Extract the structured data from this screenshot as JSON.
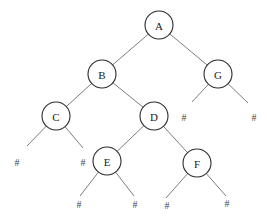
{
  "diagram": {
    "type": "binary-tree",
    "null_marker": "#",
    "node_radius": 14,
    "nodes": [
      {
        "id": "A",
        "label": "A",
        "x": 159,
        "y": 25
      },
      {
        "id": "B",
        "label": "B",
        "x": 102,
        "y": 74
      },
      {
        "id": "G",
        "label": "G",
        "x": 218,
        "y": 74
      },
      {
        "id": "C",
        "label": "C",
        "x": 56,
        "y": 116
      },
      {
        "id": "D",
        "label": "D",
        "x": 154,
        "y": 116
      },
      {
        "id": "E",
        "label": "E",
        "x": 107,
        "y": 161
      },
      {
        "id": "F",
        "label": "F",
        "x": 197,
        "y": 163
      }
    ],
    "null_leaves": [
      {
        "id": "G-left",
        "label": "#",
        "x": 184,
        "y": 117,
        "line_end": [
          192,
          102
        ]
      },
      {
        "id": "G-right",
        "label": "#",
        "x": 254,
        "y": 117,
        "line_end": [
          248,
          103
        ]
      },
      {
        "id": "C-left",
        "label": "#",
        "x": 17,
        "y": 162,
        "line_end": [
          27,
          146
        ]
      },
      {
        "id": "C-right",
        "label": "#",
        "x": 83,
        "y": 162,
        "line_end": [
          83,
          148
        ]
      },
      {
        "id": "E-left",
        "label": "#",
        "x": 79,
        "y": 204,
        "line_end": [
          80,
          196
        ]
      },
      {
        "id": "E-right",
        "label": "#",
        "x": 135,
        "y": 204,
        "line_end": [
          134,
          196
        ]
      },
      {
        "id": "F-left",
        "label": "#",
        "x": 167,
        "y": 205,
        "line_end": [
          166,
          198
        ]
      },
      {
        "id": "F-right",
        "label": "#",
        "x": 227,
        "y": 203,
        "line_end": [
          226,
          196
        ]
      }
    ],
    "edges": [
      {
        "from": "A",
        "to": "B"
      },
      {
        "from": "A",
        "to": "G"
      },
      {
        "from": "B",
        "to": "C"
      },
      {
        "from": "B",
        "to": "D"
      },
      {
        "from": "D",
        "to": "E"
      },
      {
        "from": "D",
        "to": "F"
      }
    ],
    "null_edges": [
      {
        "from": "G",
        "to": "G-left"
      },
      {
        "from": "G",
        "to": "G-right"
      },
      {
        "from": "C",
        "to": "C-left"
      },
      {
        "from": "C",
        "to": "C-right"
      },
      {
        "from": "E",
        "to": "E-left"
      },
      {
        "from": "E",
        "to": "E-right"
      },
      {
        "from": "F",
        "to": "F-left"
      },
      {
        "from": "F",
        "to": "F-right"
      }
    ]
  }
}
